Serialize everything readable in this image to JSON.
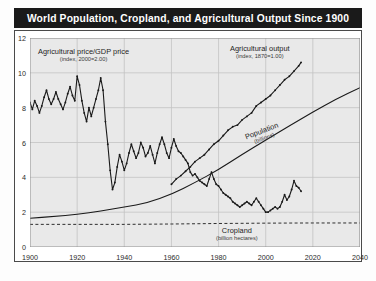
{
  "chart_data": {
    "type": "line",
    "title": "World Population, Cropland, and Agricultural Output Since 1900",
    "xlabel": "",
    "ylabel": "",
    "xlim": [
      1900,
      2040
    ],
    "ylim": [
      0,
      12
    ],
    "xticks": [
      "1900",
      "1920",
      "1940",
      "1960",
      "1980",
      "2000",
      "2020",
      "2040"
    ],
    "yticks": [
      "0",
      "2",
      "4",
      "6",
      "8",
      "10",
      "12"
    ],
    "grid": true,
    "legend_position": "inline-annotations",
    "series": [
      {
        "name": "Agricultural price/GDP price",
        "sublabel": "(index, 2000=2.00)",
        "style": "line-with-markers",
        "x": [
          1900,
          1901,
          1902,
          1903,
          1904,
          1905,
          1906,
          1907,
          1908,
          1909,
          1910,
          1911,
          1912,
          1913,
          1914,
          1915,
          1916,
          1917,
          1918,
          1919,
          1920,
          1921,
          1922,
          1923,
          1924,
          1925,
          1926,
          1927,
          1928,
          1929,
          1930,
          1931,
          1932,
          1933,
          1934,
          1935,
          1936,
          1937,
          1938,
          1939,
          1940,
          1941,
          1942,
          1943,
          1944,
          1945,
          1946,
          1947,
          1948,
          1949,
          1950,
          1951,
          1952,
          1953,
          1954,
          1955,
          1956,
          1957,
          1958,
          1959,
          1960,
          1961,
          1962,
          1963,
          1964,
          1965,
          1966,
          1967,
          1968,
          1969,
          1970,
          1971,
          1972,
          1973,
          1974,
          1975,
          1976,
          1977,
          1978,
          1979,
          1980,
          1981,
          1982,
          1983,
          1984,
          1985,
          1986,
          1987,
          1988,
          1989,
          1990,
          1991,
          1992,
          1993,
          1994,
          1995,
          1996,
          1997,
          1998,
          1999,
          2000,
          2001,
          2002,
          2003,
          2004,
          2005,
          2006,
          2007,
          2008,
          2009,
          2010,
          2011,
          2012,
          2013,
          2014,
          2015
        ],
        "values": [
          8.3,
          7.9,
          8.4,
          8.1,
          7.7,
          8.1,
          8.6,
          9.0,
          8.5,
          8.2,
          8.5,
          8.9,
          8.5,
          8.2,
          7.9,
          8.3,
          8.8,
          9.2,
          8.7,
          8.4,
          9.8,
          9.3,
          8.4,
          7.7,
          7.2,
          8.0,
          7.5,
          8.0,
          8.5,
          9.0,
          9.7,
          9.0,
          7.2,
          5.9,
          4.4,
          3.3,
          3.7,
          4.6,
          5.3,
          4.9,
          4.4,
          4.8,
          5.4,
          5.9,
          5.5,
          5.1,
          5.4,
          6.0,
          5.7,
          5.2,
          5.4,
          5.8,
          5.3,
          4.8,
          5.4,
          5.9,
          6.3,
          5.9,
          5.4,
          5.1,
          5.7,
          6.2,
          5.8,
          5.5,
          5.4,
          5.2,
          5.0,
          4.8,
          4.3,
          4.1,
          4.2,
          4.0,
          3.8,
          3.7,
          3.6,
          3.5,
          3.9,
          4.3,
          3.9,
          3.6,
          3.5,
          3.3,
          3.1,
          3.0,
          2.9,
          2.8,
          2.6,
          2.5,
          2.4,
          2.3,
          2.4,
          2.5,
          2.6,
          2.5,
          2.4,
          2.6,
          2.8,
          2.6,
          2.4,
          2.2,
          2.0,
          2.0,
          2.1,
          2.2,
          2.3,
          2.2,
          2.3,
          2.6,
          3.0,
          2.7,
          2.9,
          3.3,
          3.8,
          3.5,
          3.4,
          3.2
        ]
      },
      {
        "name": "Agricultural output",
        "sublabel": "(index, 1870=1.00)",
        "style": "line-with-markers",
        "x": [
          1960,
          1962,
          1964,
          1966,
          1968,
          1970,
          1972,
          1974,
          1976,
          1978,
          1980,
          1982,
          1984,
          1986,
          1988,
          1990,
          1992,
          1994,
          1996,
          1998,
          2000,
          2002,
          2004,
          2006,
          2008,
          2010,
          2012,
          2014,
          2015
        ],
        "values": [
          3.6,
          3.9,
          4.1,
          4.35,
          4.6,
          4.9,
          5.1,
          5.3,
          5.6,
          5.9,
          6.1,
          6.4,
          6.7,
          6.9,
          7.0,
          7.3,
          7.5,
          7.7,
          8.1,
          8.3,
          8.5,
          8.7,
          9.0,
          9.3,
          9.6,
          9.8,
          10.1,
          10.4,
          10.6
        ]
      },
      {
        "name": "Population",
        "sublabel": "(billions)",
        "style": "smooth-line",
        "x": [
          1900,
          1910,
          1920,
          1930,
          1940,
          1950,
          1960,
          1970,
          1980,
          1990,
          2000,
          2010,
          2020,
          2030,
          2040
        ],
        "values": [
          1.65,
          1.75,
          1.86,
          2.07,
          2.3,
          2.53,
          3.03,
          3.7,
          4.44,
          5.32,
          6.14,
          6.96,
          7.75,
          8.5,
          9.15
        ]
      },
      {
        "name": "Cropland",
        "sublabel": "(billion hectares)",
        "style": "dashed-line",
        "x": [
          1900,
          1920,
          1940,
          1960,
          1980,
          2000,
          2020,
          2040
        ],
        "values": [
          1.3,
          1.3,
          1.3,
          1.32,
          1.35,
          1.37,
          1.38,
          1.38
        ]
      }
    ]
  },
  "annotations": {
    "price_label": "Agricultural price/GDP price",
    "price_sub": "(index, 2000=2.00)",
    "output_label": "Agricultural output",
    "output_sub": "(index, 1870=1.00)",
    "population_label": "Population",
    "population_sub": "(billions)",
    "cropland_label": "Cropland",
    "cropland_sub": "(billion hectares)"
  },
  "colors": {
    "title_bar": "#1a1a1a",
    "title_text": "#ffffff",
    "plot_bg": "#e9e9e9",
    "grid": "#c3c3c3",
    "series": "#1a1a1a"
  }
}
